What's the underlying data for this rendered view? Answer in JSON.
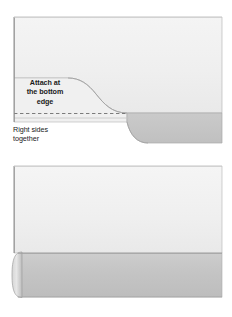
{
  "illustration": {
    "title": "Fabric folding instruction diagram",
    "colors": {
      "fabric_light": "#eeeeee",
      "fabric_light_2": "#f2f2f2",
      "fabric_gray": "#c6c6c6",
      "fabric_gray_edge": "#b8b8b8",
      "outline": "#9a9a9a",
      "outline_dark": "#8a8a8a",
      "text": "#1a1a1a",
      "background": "#ffffff"
    }
  },
  "panels": [
    {
      "id": "panel-1",
      "name": "attach-bottom-edge-panel",
      "captions": [
        {
          "id": "caption-attach",
          "text": "Attach at\nthe bottom\nedge",
          "bold": true
        },
        {
          "id": "caption-right-sides",
          "text": "Right sides\ntogether",
          "bold": false
        }
      ],
      "shapes": {
        "main_fabric": "large light panel",
        "folded_band": "gray band along bottom with S-curve",
        "dashed_stitch_line": "horizontal dashed seam line",
        "left_edge_line": "vertical dark edge at left"
      }
    },
    {
      "id": "panel-2",
      "name": "press-fold-under-panel",
      "captions": [
        {
          "id": "caption-press",
          "text": "Press the fold\nunder at the\nback",
          "bold": false
        }
      ],
      "shapes": {
        "main_fabric": "large light panel",
        "folded_band": "gray band along bottom",
        "rolled_edge": "curved rolled fold at left end of band",
        "left_edge_line": "vertical dark edge at left"
      }
    }
  ]
}
